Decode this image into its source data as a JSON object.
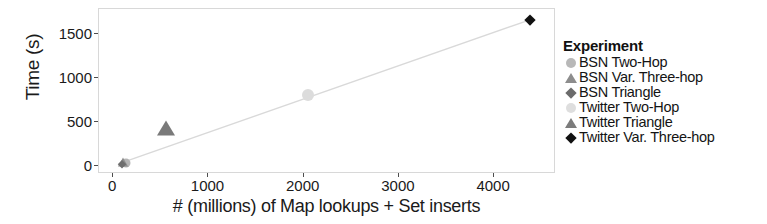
{
  "chart_data": {
    "type": "scatter",
    "title": "",
    "xlabel": "# (millions) of Map lookups + Set inserts",
    "ylabel": "Time (s)",
    "xlim": [
      -150,
      4650
    ],
    "ylim": [
      -90,
      1780
    ],
    "xticks": [
      0,
      1000,
      2000,
      3000,
      4000
    ],
    "xticklabels": [
      "0",
      "1000",
      "2000",
      "3000",
      "4000"
    ],
    "yticks": [
      0,
      500,
      1000,
      1500
    ],
    "yticklabels": [
      "0",
      "500",
      "1000",
      "1500"
    ],
    "grid": false,
    "legend_position": "right",
    "legend_title": "Experiment",
    "trendline": {
      "visible": true,
      "color": "#d9d9d9",
      "x": [
        70,
        4380
      ],
      "y": [
        10,
        1650
      ]
    },
    "series": [
      {
        "name": "BSN Two-Hop",
        "marker": "circle",
        "color": "#b5b5b5",
        "size": 9,
        "points": [
          {
            "x": 130,
            "y": 35
          }
        ]
      },
      {
        "name": "BSN Var. Three-hop",
        "marker": "triangle",
        "color": "#8c8c8c",
        "size": 11,
        "points": [
          {
            "x": 105,
            "y": 50
          }
        ]
      },
      {
        "name": "BSN Triangle",
        "marker": "diamond",
        "color": "#6e6e6e",
        "size": 8,
        "points": [
          {
            "x": 95,
            "y": 20
          }
        ]
      },
      {
        "name": "Twitter Two-Hop",
        "marker": "circle",
        "color": "#dcdcdc",
        "size": 12,
        "points": [
          {
            "x": 2050,
            "y": 800
          }
        ]
      },
      {
        "name": "Twitter Triangle",
        "marker": "triangle",
        "color": "#7a7a7a",
        "size": 18,
        "points": [
          {
            "x": 550,
            "y": 430
          }
        ]
      },
      {
        "name": "Twitter Var. Three-hop",
        "marker": "diamond",
        "color": "#111111",
        "size": 11,
        "points": [
          {
            "x": 4380,
            "y": 1650
          }
        ]
      }
    ]
  },
  "legend": {
    "title": "Experiment",
    "entries": [
      {
        "label": "BSN Two-Hop",
        "marker": "circle",
        "color": "#b8b8b8"
      },
      {
        "label": "BSN Var. Three-hop",
        "marker": "triangle",
        "color": "#8d8d8d"
      },
      {
        "label": "BSN Triangle",
        "marker": "diamond",
        "color": "#6b6b6b"
      },
      {
        "label": "Twitter Two-Hop",
        "marker": "circle",
        "color": "#dedede"
      },
      {
        "label": "Twitter Triangle",
        "marker": "triangle",
        "color": "#7c7c7c"
      },
      {
        "label": "Twitter Var. Three-hop",
        "marker": "diamond",
        "color": "#111111"
      }
    ]
  },
  "axes": {
    "x_title": "# (millions) of Map lookups + Set inserts",
    "y_title": "Time (s)"
  }
}
